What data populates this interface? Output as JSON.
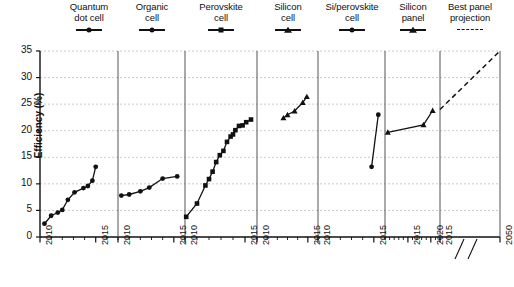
{
  "chart_data": {
    "type": "line",
    "title": "",
    "xlabel": "",
    "ylabel": "Efficiency (%)",
    "ylim": [
      0,
      35
    ],
    "yticks": [
      0,
      5,
      10,
      15,
      20,
      25,
      30,
      35
    ],
    "grid": "horizontal-dashed",
    "legend_position": "top",
    "axis_break": "//",
    "panels": [
      {
        "name": "quantum-dot-cell",
        "label": "Quantum\ndot cell",
        "marker": "circle",
        "line": "solid",
        "xlim": [
          2010,
          2017
        ],
        "xticks": [
          2010,
          2015
        ],
        "x": [
          2010.4,
          2011.0,
          2011.6,
          2012.0,
          2012.5,
          2013.1,
          2013.9,
          2014.3,
          2014.7,
          2015.0
        ],
        "y": [
          2.5,
          4.0,
          4.6,
          5.1,
          7.0,
          8.4,
          9.2,
          9.6,
          10.6,
          13.2
        ]
      },
      {
        "name": "organic-cell",
        "label": "Organic\ncell",
        "marker": "circle",
        "line": "solid",
        "xlim": [
          2010,
          2016
        ],
        "xticks": [
          2010,
          2015
        ],
        "x": [
          2010.3,
          2011.0,
          2012.0,
          2012.8,
          2014.0,
          2015.3
        ],
        "y": [
          7.8,
          8.0,
          8.6,
          9.3,
          11.0,
          11.4
        ]
      },
      {
        "name": "perovskite-cell",
        "label": "Perovskite\ncell",
        "marker": "square",
        "line": "solid",
        "xlim": [
          2010,
          2016
        ],
        "xticks": [
          2010,
          2015
        ],
        "x": [
          2010.1,
          2011.0,
          2011.7,
          2012.0,
          2012.3,
          2012.6,
          2012.9,
          2013.2,
          2013.5,
          2013.8,
          2014.0,
          2014.2,
          2014.5,
          2014.8,
          2015.1,
          2015.5
        ],
        "y": [
          3.8,
          6.3,
          9.7,
          10.9,
          12.3,
          14.1,
          15.4,
          16.2,
          17.9,
          18.9,
          19.3,
          20.1,
          20.9,
          21.0,
          21.6,
          22.1
        ]
      },
      {
        "name": "silicon-cell",
        "label": "Silicon\ncell",
        "marker": "triangle",
        "line": "solid",
        "xlim": [
          2010,
          2016
        ],
        "xticks": [
          2010,
          2015
        ],
        "x": [
          2012.6,
          2013.0,
          2013.7,
          2014.5,
          2014.9
        ],
        "y": [
          22.4,
          23.0,
          23.7,
          25.3,
          26.4
        ]
      },
      {
        "name": "si-perovskite-cell",
        "label": "Si/perovskite\ncell",
        "marker": "circle",
        "line": "solid",
        "xlim": [
          2010,
          2016
        ],
        "xticks": [
          2010,
          2015
        ],
        "x": [
          2014.8,
          2015.4
        ],
        "y": [
          13.2,
          23.0
        ]
      },
      {
        "name": "silicon-panel",
        "label": "Silicon\npanel",
        "marker": "triangle",
        "line": "solid",
        "xlim": [
          2010,
          2022
        ],
        "xticks": [
          2015,
          2020
        ],
        "x": [
          2010.6,
          2018.4,
          2020.4
        ],
        "y": [
          19.7,
          21.1,
          23.8
        ]
      },
      {
        "name": "best-panel-projection",
        "label": "Best panel\nprojection",
        "marker": "none",
        "line": "dashed",
        "xlim": [
          2015,
          2050
        ],
        "xticks": [
          2015,
          2050
        ],
        "x": [
          2015.0,
          2050.0
        ],
        "y": [
          24.0,
          35.0
        ]
      }
    ]
  },
  "legend": {
    "items": [
      {
        "label": "Quantum\ndot cell",
        "marker": "circle",
        "style": "solid",
        "name": "legend-quantum-dot-cell"
      },
      {
        "label": "Organic\ncell",
        "marker": "circle",
        "style": "solid",
        "name": "legend-organic-cell"
      },
      {
        "label": "Perovskite\ncell",
        "marker": "square",
        "style": "solid",
        "name": "legend-perovskite-cell"
      },
      {
        "label": "Silicon\ncell",
        "marker": "triangle",
        "style": "solid",
        "name": "legend-silicon-cell"
      },
      {
        "label": "Si/perovskite\ncell",
        "marker": "circle",
        "style": "solid",
        "name": "legend-si-perovskite-cell"
      },
      {
        "label": "Silicon\npanel",
        "marker": "triangle",
        "style": "solid",
        "name": "legend-silicon-panel"
      },
      {
        "label": "Best panel\nprojection",
        "marker": "none",
        "style": "dashed",
        "name": "legend-best-panel-projection"
      }
    ]
  },
  "axes": {
    "y_title": "Efficiency (%)",
    "y_tick_labels": [
      "0",
      "5",
      "10",
      "15",
      "20",
      "25",
      "30",
      "35"
    ],
    "x_tick_labels": [
      "2010",
      "2015",
      "2010",
      "2015",
      "2010",
      "2015",
      "2010",
      "2015",
      "2010",
      "2015",
      "2010",
      "2020",
      "2015",
      "2050"
    ],
    "break_symbol": "//"
  }
}
